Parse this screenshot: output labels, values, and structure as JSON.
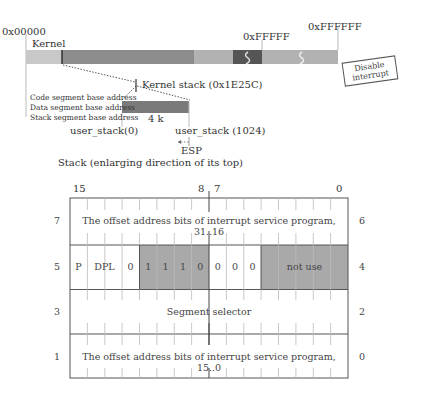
{
  "memory_map": {
    "addr_start": "0x00000",
    "addr_1mb": "0xFFFFF",
    "addr_16mb": "0xFFFFFF",
    "kernel_label": "Kernel",
    "kernel_stack_label": "Kernel stack (0x1E25C)",
    "disable_interrupt": [
      "Disable",
      "interrupt"
    ],
    "colors": {
      "light": "#c8c8c8",
      "dark": "#8a8a8a",
      "mid": "#b4b4b4",
      "darkest": "#555555"
    }
  },
  "user_stack": {
    "segment_labels": [
      "Code segment base address",
      "Data segment base address",
      "Stack segment base address"
    ],
    "size_label": "4 k",
    "start_label": "user_stack(0)",
    "end_label": "user_stack (1024)",
    "esp_label": "ESP",
    "caption": "Stack (enlarging direction of its top)"
  },
  "gate_descriptor": {
    "bit_labels": {
      "b15": "15",
      "b8": "8",
      "b7": "7",
      "b0": "0"
    },
    "rows": [
      {
        "left": "7",
        "right": "6",
        "text": "The offset address bits of interrupt service program, 31..16"
      },
      {
        "left": "5",
        "right": "4",
        "fields": {
          "p": "P",
          "dpl": "DPL",
          "zero1": "0",
          "type": [
            "1",
            "1",
            "1",
            "0"
          ],
          "zeros": [
            "0",
            "0",
            "0"
          ],
          "not_use": "not use"
        }
      },
      {
        "left": "3",
        "right": "2",
        "text": "Segment selector"
      },
      {
        "left": "1",
        "right": "0",
        "text": "The offset address bits of interrupt service program, 15..0"
      }
    ],
    "shade_color": "#a9a9a9"
  }
}
